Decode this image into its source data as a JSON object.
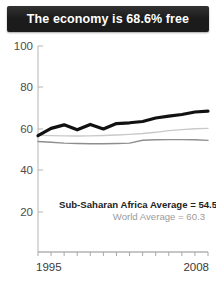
{
  "header": {
    "title": "The economy is 68.6% free",
    "background_color": "#1b1b1b",
    "text_color": "#ffffff"
  },
  "annotations": {
    "region_average": "Sub-Saharan Africa Average = 54.5",
    "world_average": "World Average = 60.3"
  },
  "axis": {
    "y_ticks": [
      "100",
      "80",
      "60",
      "40",
      "20"
    ],
    "x_start": "1995",
    "x_end": "2008"
  },
  "chart_data": {
    "type": "line",
    "title": "The economy is 68.6% free",
    "xlabel": "",
    "ylabel": "",
    "ylim": [
      10,
      100
    ],
    "xlim": [
      1995,
      2008
    ],
    "grid": false,
    "legend": "none",
    "y_ticks": [
      100,
      80,
      60,
      40,
      20
    ],
    "x_ticks": [
      1995,
      1996,
      1997,
      1998,
      1999,
      2000,
      2001,
      2002,
      2003,
      2004,
      2005,
      2006,
      2007,
      2008
    ],
    "x": [
      1995,
      1996,
      1997,
      1998,
      1999,
      2000,
      2001,
      2002,
      2003,
      2004,
      2005,
      2006,
      2007,
      2008
    ],
    "series": [
      {
        "name": "Country economic freedom score",
        "color": "#111111",
        "width": 3.2,
        "values": [
          56.8,
          60.3,
          62.0,
          59.6,
          62.2,
          60.0,
          62.6,
          63.0,
          63.6,
          65.3,
          66.2,
          67.0,
          68.2,
          68.6
        ]
      },
      {
        "name": "World Average",
        "color": "#c9c9c9",
        "width": 1.4,
        "values": [
          57.0,
          56.8,
          56.7,
          56.6,
          56.7,
          56.9,
          57.1,
          57.4,
          57.8,
          58.4,
          59.2,
          59.7,
          60.1,
          60.3
        ]
      },
      {
        "name": "Sub-Saharan Africa Average",
        "color": "#8e8e8e",
        "width": 1.4,
        "values": [
          54.0,
          53.6,
          53.2,
          53.0,
          52.9,
          52.9,
          53.0,
          53.2,
          54.6,
          54.8,
          54.9,
          54.9,
          54.8,
          54.5
        ]
      }
    ],
    "annotations": [
      {
        "text": "Sub-Saharan Africa Average = 54.5",
        "color": "#222222",
        "bold": true
      },
      {
        "text": "World Average = 60.3",
        "color": "#9b9b9b",
        "bold": false
      }
    ]
  }
}
